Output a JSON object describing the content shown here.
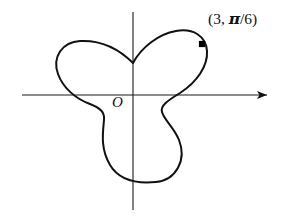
{
  "figure": {
    "width": 291,
    "height": 219,
    "background": "#ffffff",
    "curve_color": "#111111",
    "axis_color": "#1a1a1a"
  },
  "labels": {
    "origin": "O",
    "point_prefix": "(3, ",
    "point_pi": "π",
    "point_suffix": "/6)",
    "point_full": "(3, π/6)"
  },
  "axes": {
    "x_axis": {
      "x_start": 22,
      "x_end": 267,
      "y": 95,
      "arrow": "right"
    },
    "y_axis": {
      "y_start": 12,
      "y_end": 210,
      "x": 133,
      "arrow": "none"
    },
    "origin_px": {
      "x": 133,
      "y": 95
    }
  },
  "marker": {
    "name": "polar-point-3-pi-over-6",
    "cx": 202,
    "cy": 44,
    "r": 3.1,
    "shape": "filled-square-dot"
  },
  "chart_data": {
    "type": "line",
    "title": "",
    "subtitle": "",
    "xlabel": "",
    "ylabel": "",
    "grid": false,
    "legend": null,
    "coordinate_system": "polar",
    "curve_name": "three-petal limacon rose",
    "equation_hint": "r = a(1 + cos(3θ)) style three-lobed curve",
    "max_radius": 3,
    "lobes": 3,
    "lobe_axis_angles_deg": [
      30,
      150,
      270
    ],
    "cusp_angles_deg": [
      90,
      210,
      330
    ],
    "annotations": [
      {
        "text": "(3, π/6)",
        "r": 3,
        "theta": "π/6",
        "theta_deg": 30
      },
      {
        "text": "O",
        "r": 0,
        "theta_deg": 0
      }
    ],
    "polar_points": [
      {
        "theta_deg": 30,
        "r": 3.0
      },
      {
        "theta_deg": 60,
        "r": 2.1
      },
      {
        "theta_deg": 90,
        "r": 0.85
      },
      {
        "theta_deg": 120,
        "r": 2.1
      },
      {
        "theta_deg": 150,
        "r": 3.0
      },
      {
        "theta_deg": 180,
        "r": 2.1
      },
      {
        "theta_deg": 210,
        "r": 0.85
      },
      {
        "theta_deg": 240,
        "r": 2.1
      },
      {
        "theta_deg": 270,
        "r": 3.0
      },
      {
        "theta_deg": 300,
        "r": 2.1
      },
      {
        "theta_deg": 330,
        "r": 0.85
      },
      {
        "theta_deg": 360,
        "r": 2.1
      }
    ],
    "pixel_path": "M 133 63 C 141 48 158 34 176 31 C 193 28 206 36 207 51 C 208 66 197 82 180 93 C 167 101 160 106 162 112 C 164 120 174 127 179 140 C 187 160 176 180 156 182 C 136 184 119 180 110 165 C 100 148 103 132 104 120 C 105 112 100 108 90 104 C 76 99 63 88 58 74 C 52 57 62 42 80 41 C 99 40 118 48 133 63 Z"
  }
}
